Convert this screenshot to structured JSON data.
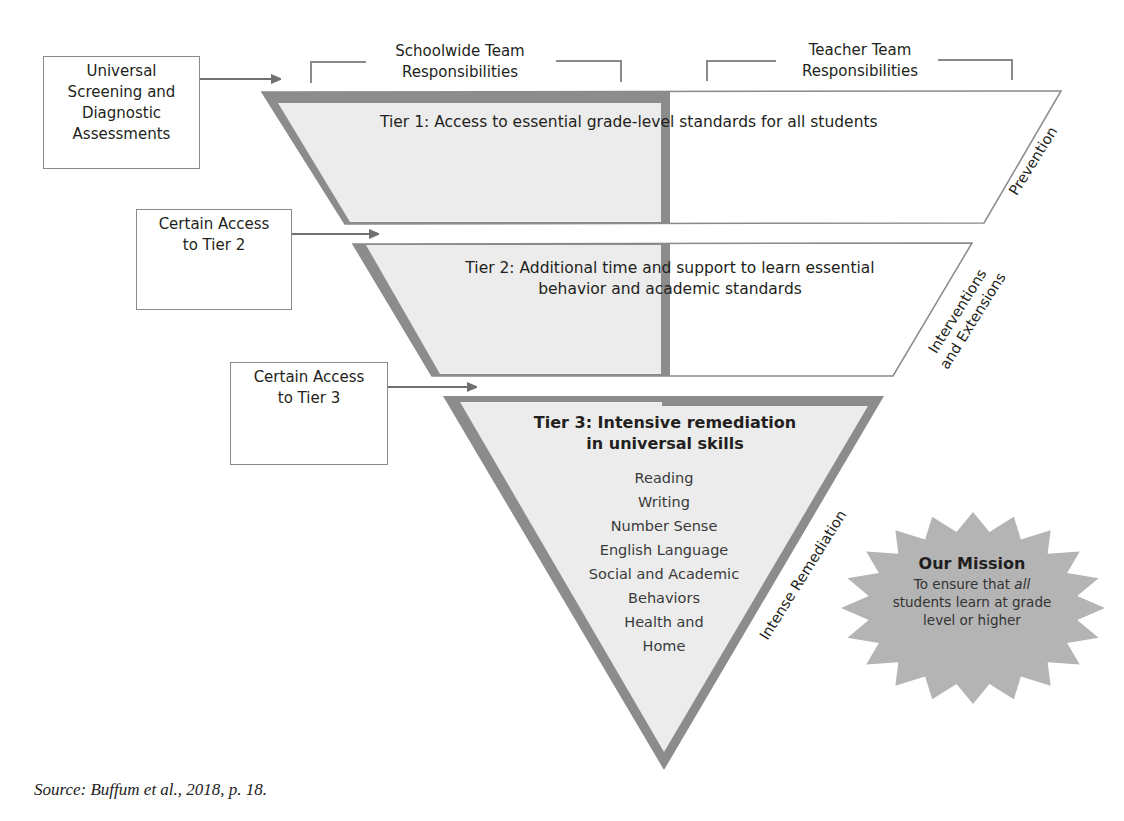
{
  "header": {
    "schoolwide": "Schoolwide Team\nResponsibilities",
    "teacher": "Teacher Team\nResponsibilities"
  },
  "entry_boxes": [
    {
      "label": "Universal\nScreening and\nDiagnostic\nAssessments"
    },
    {
      "label": "Certain Access\nto Tier 2"
    },
    {
      "label": "Certain Access\nto Tier 3"
    }
  ],
  "tiers": [
    {
      "title": "Tier 1: Access to essential grade-level standards for all students",
      "side_label": "Prevention"
    },
    {
      "title": "Tier 2: Additional time and support to learn essential\nbehavior and academic standards",
      "side_label": "Interventions\nand Extensions"
    },
    {
      "title": "Tier 3: Intensive remediation\nin universal skills",
      "side_label": "Intense Remediation",
      "skills": [
        "Reading",
        "Writing",
        "Number Sense",
        "English Language",
        "Social and Academic",
        "Behaviors",
        "Health and",
        "Home"
      ]
    }
  ],
  "mission": {
    "heading": "Our Mission",
    "line1_pre": "To ensure that ",
    "line1_emph": "all",
    "line2": "students learn at grade",
    "line3": "level or higher"
  },
  "source": "Source: Buffum et al., 2018, p. 18.",
  "colors": {
    "band": "#8c8c8c",
    "fill": "#ececec",
    "outline": "#8a8a8a",
    "starburst": "#b4b4b4"
  }
}
